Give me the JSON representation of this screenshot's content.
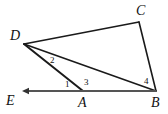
{
  "figure": {
    "background_color": "#ffffff",
    "stroke_color": "#1a1a1a",
    "width": 168,
    "height": 114
  },
  "points": {
    "D": {
      "x": 24,
      "y": 44
    },
    "C": {
      "x": 139,
      "y": 22
    },
    "B": {
      "x": 156,
      "y": 91
    },
    "A": {
      "x": 83,
      "y": 91
    },
    "E": {
      "x": 22,
      "y": 91
    }
  },
  "vertex_labels": [
    {
      "id": "D",
      "text": "D",
      "x": 10,
      "y": 29
    },
    {
      "id": "C",
      "text": "C",
      "x": 136,
      "y": 4
    },
    {
      "id": "B",
      "text": "B",
      "x": 151,
      "y": 96
    },
    {
      "id": "A",
      "text": "A",
      "x": 78,
      "y": 96
    },
    {
      "id": "E",
      "text": "E",
      "x": 6,
      "y": 94
    }
  ],
  "angle_labels": [
    {
      "id": "angle-1",
      "text": "1",
      "x": 65,
      "y": 80
    },
    {
      "id": "angle-2",
      "text": "2",
      "x": 50,
      "y": 56
    },
    {
      "id": "angle-3",
      "text": "3",
      "x": 84,
      "y": 78
    },
    {
      "id": "angle-4",
      "text": "4",
      "x": 144,
      "y": 77
    }
  ],
  "segments": [
    {
      "id": "segment-DC",
      "from": "D",
      "to": "C",
      "width": 1.6
    },
    {
      "id": "segment-CB",
      "from": "C",
      "to": "B",
      "width": 1.6
    },
    {
      "id": "segment-DB",
      "from": "D",
      "to": "B",
      "width": 1.6
    },
    {
      "id": "segment-DA",
      "from": "D",
      "to": "A",
      "width": 2.0
    },
    {
      "id": "segment-AB",
      "from": "A",
      "to": "B",
      "width": 1.8
    }
  ],
  "ray": {
    "id": "ray-AE",
    "from": "A",
    "to": "E",
    "arrow_at": "E",
    "width": 1.8
  }
}
